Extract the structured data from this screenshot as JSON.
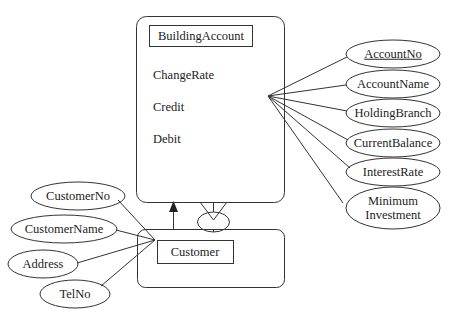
{
  "diagram": {
    "type": "ER diagram",
    "entities": [
      {
        "name": "BuildingAccount",
        "operations": [
          "ChangeRate",
          "Credit",
          "Debit"
        ],
        "attributes": [
          {
            "label": "AccountNo",
            "key": true
          },
          {
            "label": "AccountName",
            "key": false
          },
          {
            "label": "HoldingBranch",
            "key": false
          },
          {
            "label": "CurrentBalance",
            "key": false
          },
          {
            "label": "InterestRate",
            "key": false
          },
          {
            "label": "Minimum Investment",
            "line1": "Minimum",
            "line2": "Investment",
            "key": false
          }
        ]
      },
      {
        "name": "Customer",
        "attributes": [
          {
            "label": "CustomerNo"
          },
          {
            "label": "CustomerName"
          },
          {
            "label": "Address"
          },
          {
            "label": "TelNo"
          }
        ]
      }
    ],
    "relationships": [
      {
        "from": "Customer",
        "to": "BuildingAccount",
        "type": "arrow"
      },
      {
        "from": "Customer",
        "to": "BuildingAccount",
        "type": "one-to-many (crow's foot) with relationship ellipse"
      }
    ],
    "colors": {
      "stroke": "#333333",
      "text": "#222222",
      "background": "#ffffff"
    }
  }
}
